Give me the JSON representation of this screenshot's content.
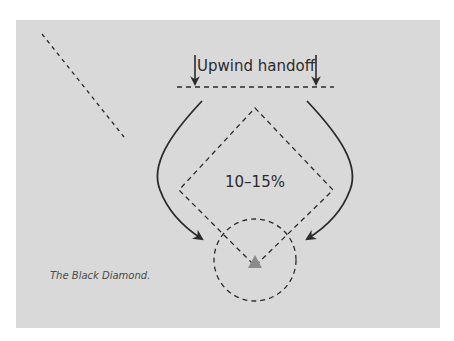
{
  "diagram": {
    "title_label": "Upwind handoff",
    "center_label": "10–15%",
    "caption": "The Black Diamond.",
    "colors": {
      "background": "#ffffff",
      "panel": "#d9d9d9",
      "stroke": "#2b2b2b",
      "marker": "#8a8a8a"
    },
    "elements": {
      "handoff_line": "dashed horizontal line",
      "diamond": "dashed diamond course",
      "circle": "dashed circle around bottom mark",
      "mark": "gray triangle mark",
      "left_arrow": "curved arrow left side",
      "right_arrow": "curved arrow right side",
      "diagonal": "dashed diagonal line top-left"
    }
  }
}
